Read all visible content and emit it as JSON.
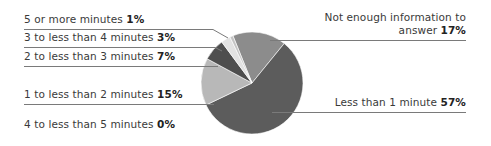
{
  "chart_data": {
    "type": "pie",
    "title": "",
    "start_angle_deg": -22,
    "direction": "clockwise",
    "center": [
      252,
      83
    ],
    "radius": 51,
    "slices": [
      {
        "label": "Not enough information to answer",
        "value": 17,
        "color": "#8c8c8c"
      },
      {
        "label": "Less than 1 minute",
        "value": 57,
        "color": "#5c5c5c"
      },
      {
        "label": "4 to less than 5 minutes",
        "value": 0,
        "color": "#9a9a9a"
      },
      {
        "label": "1 to less than 2 minutes",
        "value": 15,
        "color": "#b8b8b8"
      },
      {
        "label": "2 to less than 3 minutes",
        "value": 7,
        "color": "#4e4e4e"
      },
      {
        "label": "3 to less than 4 minutes",
        "value": 3,
        "color": "#e2e2e2"
      },
      {
        "label": "5 or more minutes",
        "value": 1,
        "color": "#c4c4c4"
      }
    ],
    "unit": "%"
  },
  "labels": {
    "five_plus": {
      "text": "5 or more minutes ",
      "pct": "1%"
    },
    "three_four": {
      "text": "3 to less than 4 minutes ",
      "pct": "3%"
    },
    "two_three": {
      "text": "2 to less than 3 minutes ",
      "pct": "7%"
    },
    "one_two": {
      "text": "1 to less than 2 minutes ",
      "pct": "15%"
    },
    "four_five": {
      "text": "4 to less than 5 minutes ",
      "pct": "0%"
    },
    "not_enough_line1": {
      "text": "Not enough information to"
    },
    "not_enough_line2": {
      "text": "answer ",
      "pct": "17%"
    },
    "less_one": {
      "text": "Less than 1 minute ",
      "pct": "57%"
    }
  }
}
